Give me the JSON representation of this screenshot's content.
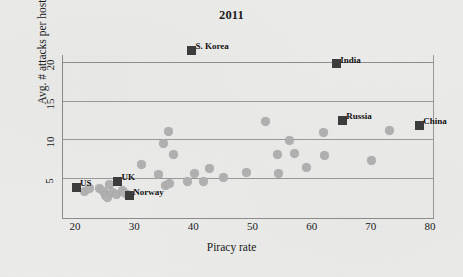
{
  "chart_data": {
    "type": "scatter",
    "title": "2011",
    "xlabel": "Piracy rate",
    "ylabel": "Avg. # attacks per host",
    "xlim": [
      18,
      82
    ],
    "ylim": [
      1.5,
      23
    ],
    "xticks": [
      20,
      30,
      40,
      50,
      60,
      70,
      80
    ],
    "yticks": [
      5,
      10,
      15,
      20
    ],
    "grid": "horizontal",
    "legend": "none",
    "series": [
      {
        "name": "countries",
        "marker": "circle",
        "color": "#b2b2b2",
        "points": [
          {
            "x": 21.5,
            "y": 3.3
          },
          {
            "x": 22.3,
            "y": 3.7
          },
          {
            "x": 24.0,
            "y": 3.6
          },
          {
            "x": 24.6,
            "y": 3.3
          },
          {
            "x": 25.0,
            "y": 2.7
          },
          {
            "x": 25.3,
            "y": 2.5
          },
          {
            "x": 25.6,
            "y": 4.1
          },
          {
            "x": 26.2,
            "y": 3.1
          },
          {
            "x": 26.8,
            "y": 2.9
          },
          {
            "x": 27.8,
            "y": 3.4
          },
          {
            "x": 28.4,
            "y": 3.0
          },
          {
            "x": 31.0,
            "y": 6.7
          },
          {
            "x": 34.0,
            "y": 5.4
          },
          {
            "x": 34.8,
            "y": 9.4
          },
          {
            "x": 35.2,
            "y": 4.0
          },
          {
            "x": 35.6,
            "y": 11.0
          },
          {
            "x": 35.8,
            "y": 4.3
          },
          {
            "x": 36.4,
            "y": 8.0
          },
          {
            "x": 38.8,
            "y": 4.6
          },
          {
            "x": 40.1,
            "y": 5.6
          },
          {
            "x": 41.6,
            "y": 4.6
          },
          {
            "x": 42.6,
            "y": 6.2
          },
          {
            "x": 45.0,
            "y": 5.1
          },
          {
            "x": 48.8,
            "y": 5.7
          },
          {
            "x": 52.0,
            "y": 12.3
          },
          {
            "x": 54.0,
            "y": 8.1
          },
          {
            "x": 54.2,
            "y": 5.6
          },
          {
            "x": 56.0,
            "y": 9.9
          },
          {
            "x": 57.0,
            "y": 8.2
          },
          {
            "x": 59.0,
            "y": 6.3
          },
          {
            "x": 61.8,
            "y": 10.9
          },
          {
            "x": 62.0,
            "y": 7.9
          },
          {
            "x": 70.0,
            "y": 7.2
          },
          {
            "x": 73.0,
            "y": 11.1
          }
        ]
      },
      {
        "name": "highlighted countries",
        "marker": "square",
        "color": "#3d3d3d",
        "points": [
          {
            "x": 20.0,
            "y": 3.8,
            "label": "US",
            "label_pos": "right"
          },
          {
            "x": 27.0,
            "y": 4.6,
            "label": "UK",
            "label_pos": "right"
          },
          {
            "x": 29.0,
            "y": 2.7,
            "label": "Norway",
            "label_pos": "right"
          },
          {
            "x": 39.5,
            "y": 21.5,
            "label": "S. Korea",
            "label_pos": "right"
          },
          {
            "x": 64.0,
            "y": 19.8,
            "label": "India",
            "label_pos": "right"
          },
          {
            "x": 65.0,
            "y": 12.5,
            "label": "Russia",
            "label_pos": "right"
          },
          {
            "x": 78.0,
            "y": 11.8,
            "label": "China",
            "label_pos": "right"
          }
        ]
      }
    ]
  },
  "colors": {
    "background": "#ececeb",
    "point": "#b2b2b2",
    "highlight": "#3d3d3d",
    "grid": "#9b9b9b",
    "axis": "#8d8d8d",
    "text": "#1b1b1b"
  }
}
